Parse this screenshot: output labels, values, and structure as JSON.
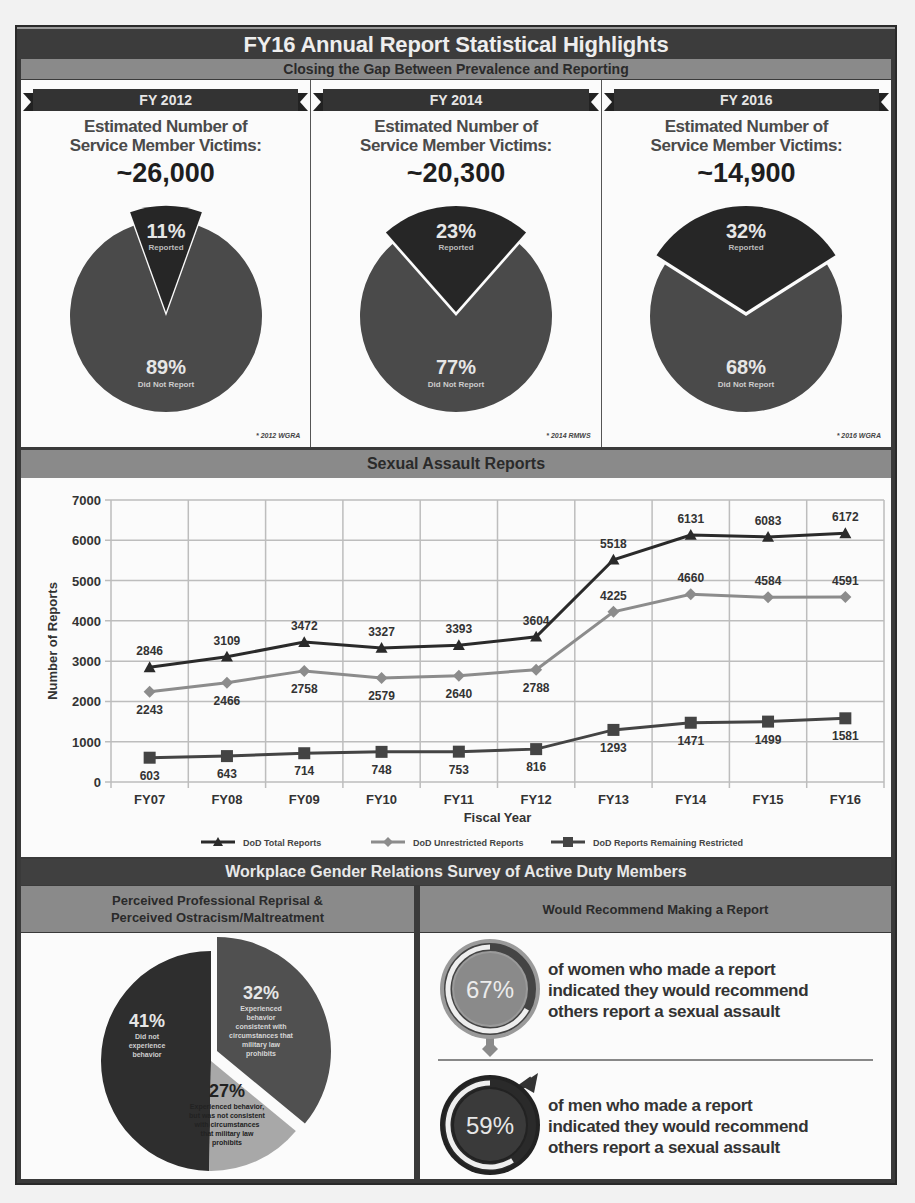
{
  "title": "FY16 Annual Report Statistical Highlights",
  "prevalence_section": {
    "heading": "Closing the Gap Between Prevalence and Reporting",
    "columns": [
      {
        "year_label": "FY 2012",
        "estimate_label_line1": "Estimated Number of",
        "estimate_label_line2": "Service Member Victims:",
        "estimate_value": "~26,000",
        "reported_pct": "11%",
        "reported_label": "Reported",
        "not_reported_pct": "89%",
        "not_reported_label": "Did Not Report",
        "source": "* 2012 WGRA"
      },
      {
        "year_label": "FY 2014",
        "estimate_label_line1": "Estimated Number of",
        "estimate_label_line2": "Service Member Victims:",
        "estimate_value": "~20,300",
        "reported_pct": "23%",
        "reported_label": "Reported",
        "not_reported_pct": "77%",
        "not_reported_label": "Did Not Report",
        "source": "* 2014 RMWS"
      },
      {
        "year_label": "FY 2016",
        "estimate_label_line1": "Estimated Number of",
        "estimate_label_line2": "Service Member Victims:",
        "estimate_value": "~14,900",
        "reported_pct": "32%",
        "reported_label": "Reported",
        "not_reported_pct": "68%",
        "not_reported_label": "Did Not Report",
        "source": "* 2016 WGRA"
      }
    ]
  },
  "reports_section": {
    "heading": "Sexual Assault Reports"
  },
  "survey_section": {
    "heading": "Workplace Gender Relations Survey of Active Duty Members",
    "left_header_line1": "Perceived Professional Reprisal &",
    "left_header_line2": "Perceived Ostracism/Maltreatment",
    "right_header": "Would Recommend Making a Report",
    "pie": [
      {
        "pct": "41%",
        "label_lines": [
          "Did not",
          "experience",
          "behavior"
        ],
        "color": "#2e2e2e"
      },
      {
        "pct": "32%",
        "label_lines": [
          "Experienced",
          "behavior",
          "consistent with",
          "circumstances that",
          "military law",
          "prohibits"
        ],
        "color": "#505050"
      },
      {
        "pct": "27%",
        "label_lines": [
          "Experienced behavior,",
          "but was not consistent",
          "with circumstances",
          "that military law",
          "prohibits"
        ],
        "color": "#a8a8a8"
      }
    ],
    "recommend": [
      {
        "pct": "67%",
        "text_line1": "of women who made a report",
        "text_line2": "indicated they would recommend",
        "text_line3": "others report a sexual assault",
        "icon": "female-symbol-icon"
      },
      {
        "pct": "59%",
        "text_line1": "of men who made a report",
        "text_line2": "indicated they would recommend",
        "text_line3": "others report a sexual assault",
        "icon": "male-symbol-icon"
      }
    ]
  },
  "chart_data": [
    {
      "type": "pie",
      "title": "FY 2012 Estimated Number of Service Member Victims: ~26,000",
      "categories": [
        "Reported",
        "Did Not Report"
      ],
      "values": [
        11,
        89
      ],
      "source": "2012 WGRA"
    },
    {
      "type": "pie",
      "title": "FY 2014 Estimated Number of Service Member Victims: ~20,300",
      "categories": [
        "Reported",
        "Did Not Report"
      ],
      "values": [
        23,
        77
      ],
      "source": "2014 RMWS"
    },
    {
      "type": "pie",
      "title": "FY 2016 Estimated Number of Service Member Victims: ~14,900",
      "categories": [
        "Reported",
        "Did Not Report"
      ],
      "values": [
        32,
        68
      ],
      "source": "2016 WGRA"
    },
    {
      "type": "line",
      "title": "Sexual Assault Reports",
      "xlabel": "Fiscal Year",
      "ylabel": "Number of Reports",
      "categories": [
        "FY07",
        "FY08",
        "FY09",
        "FY10",
        "FY11",
        "FY12",
        "FY13",
        "FY14",
        "FY15",
        "FY16"
      ],
      "yticks": [
        0,
        1000,
        2000,
        3000,
        4000,
        5000,
        6000,
        7000
      ],
      "ylim": [
        0,
        7000
      ],
      "grid": true,
      "legend_position": "bottom",
      "series": [
        {
          "name": "DoD Total Reports",
          "marker": "triangle",
          "color": "#2a2a2a",
          "values": [
            2846,
            3109,
            3472,
            3327,
            3393,
            3604,
            5518,
            6131,
            6083,
            6172
          ]
        },
        {
          "name": "DoD Unrestricted Reports",
          "marker": "diamond",
          "color": "#8c8c8c",
          "values": [
            2243,
            2466,
            2758,
            2579,
            2640,
            2788,
            4225,
            4660,
            4584,
            4591
          ]
        },
        {
          "name": "DoD Reports Remaining Restricted",
          "marker": "square",
          "color": "#444444",
          "values": [
            603,
            643,
            714,
            748,
            753,
            816,
            1293,
            1471,
            1499,
            1581
          ]
        }
      ]
    },
    {
      "type": "pie",
      "title": "Perceived Professional Reprisal & Perceived Ostracism/Maltreatment",
      "categories": [
        "Did not experience behavior",
        "Experienced behavior consistent with circumstances that military law prohibits",
        "Experienced behavior, but was not consistent with circumstances that military law prohibits"
      ],
      "values": [
        41,
        32,
        27
      ]
    },
    {
      "type": "bar",
      "title": "Would Recommend Making a Report",
      "categories": [
        "Women who made a report",
        "Men who made a report"
      ],
      "values": [
        67,
        59
      ],
      "unit": "%"
    }
  ]
}
